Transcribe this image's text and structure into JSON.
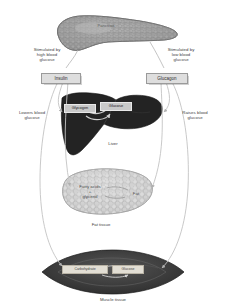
{
  "diagram": {
    "colors": {
      "pancreas": "#9a9a9a",
      "pancreas_cells": "#8c8c8c",
      "liver": "#1e1e1e",
      "fat_tissue": "#cfcfcf",
      "muscle_tissue": "#3a3a3a",
      "arrow": "#b5b5b5",
      "text": "#3d3d3d",
      "box_fill": "#dedede"
    },
    "organs": {
      "pancreas": {
        "label": "Pancreas"
      },
      "liver": {
        "caption": "Liver",
        "inner_left": "Glycogen",
        "inner_right": "Glucose"
      },
      "fat_tissue": {
        "caption": "Fat tissue",
        "inner_left": "Fatty acids\n+\nglycerol",
        "inner_right": "Fat"
      },
      "muscle_tissue": {
        "caption": "Muscle tissue",
        "inner_left": "Carbohydrate",
        "inner_right": "Glucose"
      }
    },
    "hormones": {
      "insulin": {
        "name": "Insulin",
        "stimulus": "Stimulated by\nhigh blood\nglucose",
        "effect": "Lowers blood\nglucose"
      },
      "glucagon": {
        "name": "Glucagon",
        "stimulus": "Stimulated by\nlow blood\nglucose",
        "effect": "Raises blood\nglucose"
      }
    }
  }
}
